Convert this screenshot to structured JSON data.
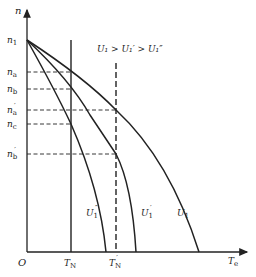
{
  "diagram": {
    "y_axis_label": "n",
    "x_axis_label": "T",
    "x_axis_label_sub": "e",
    "origin_label": "O",
    "condition_text": "U₁ > U₁′ > U₁″",
    "y_ticks": [
      {
        "id": "n1",
        "base": "n",
        "sub": "1",
        "prime": ""
      },
      {
        "id": "na",
        "base": "n",
        "sub": "a",
        "prime": ""
      },
      {
        "id": "nb",
        "base": "n",
        "sub": "b",
        "prime": ""
      },
      {
        "id": "na_p",
        "base": "n",
        "sub": "a",
        "prime": "′"
      },
      {
        "id": "nc",
        "base": "n",
        "sub": "c",
        "prime": ""
      },
      {
        "id": "nb_p",
        "base": "n",
        "sub": "b",
        "prime": "′"
      }
    ],
    "x_ticks": [
      {
        "id": "TN",
        "base": "T",
        "sub": "N",
        "prime": ""
      },
      {
        "id": "TN_p",
        "base": "T",
        "sub": "N",
        "prime": "′"
      }
    ],
    "curves": [
      {
        "id": "U1pp",
        "base": "U",
        "sub": "1",
        "prime": "″"
      },
      {
        "id": "U1p",
        "base": "U",
        "sub": "1",
        "prime": "′"
      },
      {
        "id": "U1",
        "base": "U",
        "sub": "1",
        "prime": ""
      }
    ],
    "colors": {
      "line": "#222222",
      "background": "#ffffff"
    }
  }
}
